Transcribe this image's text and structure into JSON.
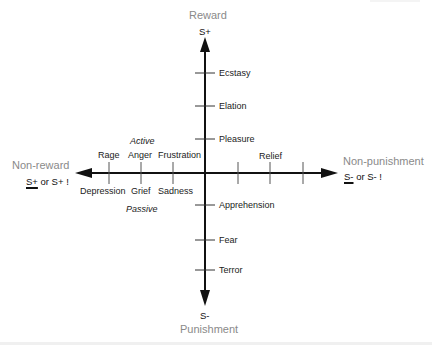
{
  "diagram": {
    "type": "emotion-reinforcement-axes",
    "axes": {
      "vertical": {
        "top_pole": "Reward",
        "top_symbol": "S+",
        "bottom_pole": "Punishment",
        "bottom_symbol": "S-"
      },
      "horizontal": {
        "left_pole": "Non-reward",
        "left_symbol_underlined": "S+",
        "left_symbol_rest": " or S+ !",
        "right_pole": "Non-punishment",
        "right_symbol_underlined": "S-",
        "right_symbol_rest": " or S- !"
      }
    },
    "vertical_upper_emotions": [
      "Ecstasy",
      "Elation",
      "Pleasure"
    ],
    "vertical_lower_emotions": [
      "Apprehension",
      "Fear",
      "Terror"
    ],
    "left_active_label": "Active",
    "left_passive_label": "Passive",
    "left_upper_emotions": [
      "Rage",
      "Anger",
      "Frustration"
    ],
    "left_lower_emotions": [
      "Depression",
      "Grief",
      "Sadness"
    ],
    "right_emotions": [
      "Relief"
    ],
    "colors": {
      "axis": "#111111",
      "pole_text": "#8a8a8a",
      "label_text": "#222222",
      "tick": "#333333"
    }
  }
}
